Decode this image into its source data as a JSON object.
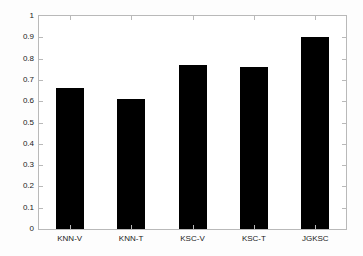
{
  "chart_data": {
    "type": "bar",
    "title": "",
    "xlabel": "",
    "ylabel": "",
    "categories": [
      "KNN-V",
      "KNN-T",
      "KSC-V",
      "KSC-T",
      "JGKSC"
    ],
    "values": [
      0.66,
      0.61,
      0.77,
      0.76,
      0.9
    ],
    "ylim": [
      0,
      1
    ],
    "yticks": [
      0,
      0.1,
      0.2,
      0.3,
      0.4,
      0.5,
      0.6,
      0.7,
      0.8,
      0.9,
      1
    ],
    "ytick_labels": [
      "0",
      "0.1",
      "0.2",
      "0.3",
      "0.4",
      "0.5",
      "0.6",
      "0.7",
      "0.8",
      "0.9",
      "1"
    ],
    "grid": false,
    "legend": null,
    "bar_color": "#000000",
    "axis_color": "#b9b9b9",
    "background_color": "#ffffff",
    "series": [
      {
        "name": "accuracy",
        "values": [
          0.66,
          0.61,
          0.77,
          0.76,
          0.9
        ]
      }
    ]
  }
}
